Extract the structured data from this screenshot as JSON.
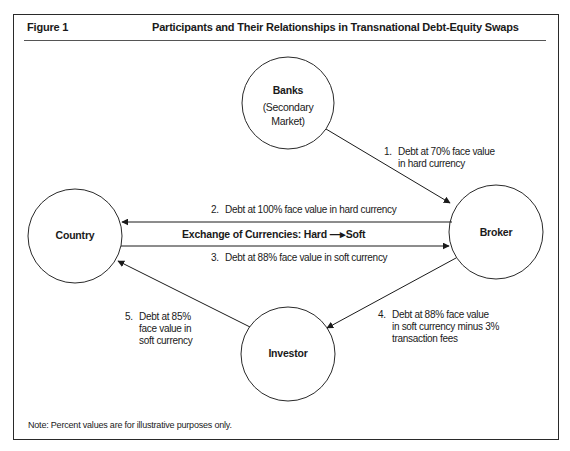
{
  "figure": {
    "label": "Figure 1",
    "title": "Participants and Their Relationships in Transnational Debt-Equity Swaps",
    "note": "Note: Percent values are for illustrative purposes only."
  },
  "nodes": {
    "banks": {
      "label": "Banks",
      "sub1": "(Secondary",
      "sub2": "Market)"
    },
    "country": {
      "label": "Country"
    },
    "broker": {
      "label": "Broker"
    },
    "investor": {
      "label": "Investor"
    }
  },
  "flows": [
    {
      "num": "1.",
      "line1": "Debt at 70% face value",
      "line2": "in hard currency",
      "from": "banks",
      "to": "broker"
    },
    {
      "num": "2.",
      "line1": "Debt at 100% face value in hard currency",
      "from": "broker",
      "to": "country"
    },
    {
      "num": "3.",
      "line1": "Debt at 88% face value in soft currency",
      "from": "country",
      "to": "broker"
    },
    {
      "num": "4.",
      "line1": "Debt at 88% face value",
      "line2": "in soft currency minus 3%",
      "line3": "transaction fees",
      "from": "broker",
      "to": "investor"
    },
    {
      "num": "5.",
      "line1": "Debt at 85%",
      "line2": "face value in",
      "line3": "soft currency",
      "from": "investor",
      "to": "country"
    }
  ],
  "exchange": {
    "label": "Exchange of Currencies: Hard",
    "arrow": "—▸",
    "target": "Soft"
  }
}
